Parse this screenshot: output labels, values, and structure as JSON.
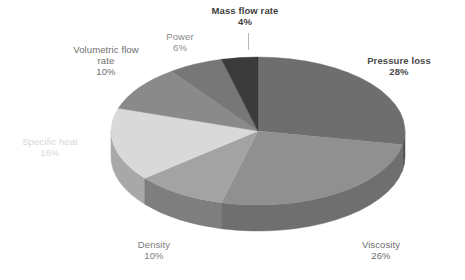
{
  "chart_data": {
    "type": "pie",
    "title": "",
    "subtitle": "",
    "xlabel": "",
    "ylabel": "",
    "legend_position": "none",
    "grid": false,
    "three_d": true,
    "categories": [
      "Pressure loss",
      "Viscosity",
      "Density",
      "Specific heat",
      "Volumetric flow rate",
      "Power",
      "Mass flow rate"
    ],
    "values": [
      28,
      26,
      10,
      16,
      10,
      6,
      4
    ],
    "unit": "%",
    "slices": [
      {
        "label": "Pressure loss",
        "value": 28,
        "pct_text": "28%",
        "color": "#6e6e6e",
        "side_color": "#555555",
        "label_color": "#4a4a4a",
        "bold": true
      },
      {
        "label": "Viscosity",
        "value": 26,
        "pct_text": "26%",
        "color": "#909090",
        "side_color": "#6f6f6f",
        "label_color": "#6a6a6a",
        "bold": false
      },
      {
        "label": "Density",
        "value": 10,
        "pct_text": "10%",
        "color": "#a3a3a3",
        "side_color": "#7e7e7e",
        "label_color": "#7d7d7d",
        "bold": false
      },
      {
        "label": "Specific heat",
        "value": 16,
        "pct_text": "16%",
        "color": "#d9d9d9",
        "side_color": "#a8a8a8",
        "label_color": "#d9d9d9",
        "bold": false
      },
      {
        "label": "Volumetric flow rate",
        "value": 10,
        "pct_text": "10%",
        "color": "#8a8a8a",
        "side_color": "#6b6b6b",
        "label_color": "#6d6d6d",
        "bold": false
      },
      {
        "label": "Power",
        "value": 6,
        "pct_text": "6%",
        "color": "#777777",
        "side_color": "#5d5d5d",
        "label_color": "#8a8a8a",
        "bold": false
      },
      {
        "label": "Mass flow rate",
        "value": 4,
        "pct_text": "4%",
        "color": "#3a3a3a",
        "side_color": "#2e2e2e",
        "label_color": "#3f3f3f",
        "bold": true
      }
    ]
  },
  "labels": {
    "mass_flow_rate": {
      "name": "Mass flow rate",
      "pct": "4%"
    },
    "power": {
      "name": "Power",
      "pct": "6%"
    },
    "volumetric_line1": {
      "name": "Volumetric flow",
      "pct": ""
    },
    "volumetric": {
      "name": "rate",
      "pct": "10%"
    },
    "specific_heat": {
      "name": "Specific heat",
      "pct": "16%"
    },
    "density": {
      "name": "Density",
      "pct": "10%"
    },
    "viscosity": {
      "name": "Viscosity",
      "pct": "26%"
    },
    "pressure_loss": {
      "name": "Pressure loss",
      "pct": "28%"
    }
  },
  "colors": {
    "background": "#ffffff",
    "pressure_loss": "#6e6e6e",
    "viscosity": "#909090",
    "density": "#a3a3a3",
    "specific_heat": "#d9d9d9",
    "volumetric_flow_rate": "#8a8a8a",
    "power": "#777777",
    "mass_flow_rate": "#3a3a3a"
  }
}
